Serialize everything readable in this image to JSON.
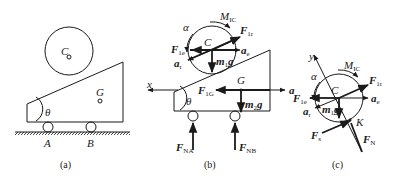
{
  "panels": [
    {
      "id": "a",
      "caption": "(a)",
      "labels": {
        "C": "C",
        "G": "G",
        "theta": "θ",
        "A": "A",
        "B": "B"
      }
    },
    {
      "id": "b",
      "caption": "(b)",
      "labels": {
        "alpha": "α",
        "M_main": "M",
        "M_sub": "IC",
        "F1r_main": "F",
        "F1r_sub": "1r",
        "F1e_main": "F",
        "F1e_sub": "1e",
        "C": "C",
        "ae_main": "a",
        "ae_sub": "e",
        "ar_main": "a",
        "ar_sub": "r",
        "m1g_main": "m",
        "m1g_sub": "1",
        "m1g_end": "g",
        "x": "x",
        "F1G_main": "F",
        "F1G_sub": "1G",
        "G": "G",
        "a": "a",
        "theta": "θ",
        "m2g_main": "m",
        "m2g_sub": "2",
        "m2g_end": "g",
        "FNA_main": "F",
        "FNA_sub": "NA",
        "FNB_main": "F",
        "FNB_sub": "NB"
      }
    },
    {
      "id": "c",
      "caption": "(c)",
      "labels": {
        "y": "y",
        "alpha": "α",
        "M_main": "M",
        "M_sub": "IC",
        "F1r_main": "F",
        "F1r_sub": "1r",
        "F1e_main": "F",
        "F1e_sub": "1e",
        "C": "C",
        "ae_main": "a",
        "ae_sub": "e",
        "ar_main": "a",
        "ar_sub": "r",
        "m1g_main": "m",
        "m1g_sub": "1",
        "m1g_end": "g",
        "K": "K",
        "Fs_main": "F",
        "Fs_sub": "s",
        "FN_main": "F",
        "FN_sub": "N"
      }
    }
  ],
  "colors": {
    "ink": "#1a1a1a",
    "background": "#ffffff"
  }
}
